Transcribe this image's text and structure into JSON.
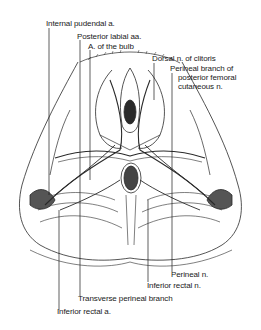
{
  "diagram": {
    "labels": {
      "internal_pudendal_a": "Internal pudendal a.",
      "posterior_labial_aa": "Posterior labial aa.",
      "a_of_the_bulb": "A. of the bulb",
      "dorsal_n_of_clitoris": "Dorsal n. of clitoris",
      "perineal_branch_line1": "Perineal branch of",
      "perineal_branch_line2": "posterior femoral",
      "perineal_branch_line3": "cutaneous n.",
      "perineal_n": "Perineal n.",
      "inferior_rectal_n": "Inferior rectal n.",
      "transverse_perineal_branch": "Transverse perineal branch",
      "inferior_rectal_a": "Inferior rectal a."
    }
  }
}
